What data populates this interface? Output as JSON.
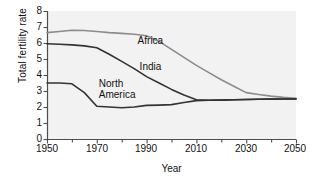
{
  "chart_data": {
    "type": "line",
    "title": "",
    "xlabel": "Year",
    "ylabel": "Total fertility rate",
    "xlim": [
      1950,
      2050
    ],
    "ylim": [
      0,
      8
    ],
    "xticks": [
      1950,
      1970,
      1990,
      2010,
      2030,
      2050
    ],
    "yticks": [
      0,
      1,
      2,
      3,
      4,
      5,
      6,
      7,
      8
    ],
    "xminor_step": 10,
    "grid": false,
    "legend": "inline-labels",
    "plot_bgcolor": "#f2f2f2",
    "axis_color": "#4d4d4d",
    "series": [
      {
        "name": "Africa",
        "color": "#8c8c8c",
        "label_x": 1988,
        "label_y": 6.15,
        "x": [
          1950,
          1955,
          1960,
          1965,
          1970,
          1975,
          1980,
          1985,
          1990,
          1995,
          2000,
          2005,
          2010,
          2015,
          2020,
          2025,
          2030,
          2035,
          2040,
          2045,
          2050
        ],
        "values": [
          6.65,
          6.72,
          6.8,
          6.78,
          6.72,
          6.65,
          6.6,
          6.55,
          6.45,
          6.1,
          5.6,
          5.1,
          4.6,
          4.15,
          3.7,
          3.3,
          2.9,
          2.78,
          2.68,
          2.6,
          2.55
        ]
      },
      {
        "name": "India",
        "color": "#333333",
        "label_x": 1988,
        "label_y": 4.5,
        "x": [
          1950,
          1955,
          1960,
          1965,
          1970,
          1975,
          1980,
          1985,
          1990,
          1995,
          2000,
          2005,
          2010,
          2015,
          2020,
          2025,
          2030,
          2035,
          2040,
          2045,
          2050
        ],
        "values": [
          5.95,
          5.92,
          5.88,
          5.82,
          5.7,
          5.3,
          4.85,
          4.4,
          3.9,
          3.5,
          3.1,
          2.75,
          2.45,
          2.42,
          2.43,
          2.45,
          2.47,
          2.48,
          2.49,
          2.5,
          2.5
        ]
      },
      {
        "name": "North America",
        "color": "#333333",
        "label_x": 1972,
        "label_y": 3.4,
        "x": [
          1950,
          1955,
          1960,
          1965,
          1970,
          1975,
          1980,
          1985,
          1990,
          1995,
          2000,
          2005,
          2010,
          2015,
          2020,
          2025,
          2030,
          2035,
          2040,
          2045,
          2050
        ],
        "values": [
          3.5,
          3.5,
          3.45,
          2.9,
          2.05,
          2.0,
          1.95,
          2.0,
          2.1,
          2.12,
          2.15,
          2.28,
          2.4,
          2.42,
          2.43,
          2.45,
          2.47,
          2.48,
          2.49,
          2.5,
          2.5
        ]
      }
    ]
  },
  "labels": {
    "africa": "Africa",
    "india": "India",
    "north_america_line1": "North",
    "north_america_line2": "America",
    "axis_x": "Year",
    "axis_y": "Total fertility rate"
  },
  "ytick_labels": [
    "8",
    "7",
    "6",
    "5",
    "4",
    "3",
    "2",
    "1",
    "0"
  ],
  "xtick_labels": [
    "1950",
    "1970",
    "1990",
    "2010",
    "2030",
    "2050"
  ]
}
